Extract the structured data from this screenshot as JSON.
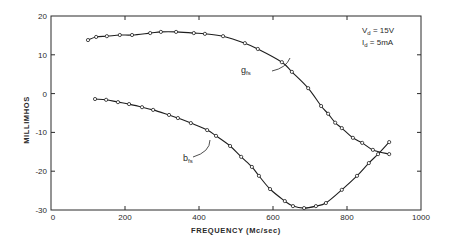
{
  "chart_data": {
    "type": "line",
    "title": "",
    "xlabel": "FREQUENCY  (Mc/sec)",
    "ylabel": "MILLIMHOS",
    "xlim": [
      0,
      1000
    ],
    "ylim": [
      -30,
      20
    ],
    "xticks": [
      0,
      200,
      400,
      600,
      800,
      1000
    ],
    "yticks": [
      20,
      10,
      0,
      -10,
      -20,
      -30
    ],
    "xtick_labels": [
      "0",
      "200",
      "400",
      "600",
      "800",
      "1000"
    ],
    "ytick_labels": [
      "20",
      "10",
      "0",
      "-10",
      "-20",
      "-30"
    ],
    "grid": false,
    "annotations": {
      "line1": "Vd = 15V",
      "line2": "Id = 5mA"
    },
    "series": [
      {
        "name": "g_fs",
        "label_main": "g",
        "label_sub": "fs",
        "x": [
          100,
          122,
          151,
          186,
          219,
          268,
          297,
          338,
          386,
          416,
          465,
          524,
          559,
          624,
          651,
          695,
          730,
          749,
          768,
          786,
          816,
          841,
          870,
          914
        ],
        "y": [
          13.8,
          14.6,
          14.8,
          15.1,
          15.1,
          15.6,
          15.9,
          15.9,
          15.6,
          15.4,
          14.8,
          13.0,
          11.5,
          8.1,
          5.6,
          1.4,
          -3.2,
          -5.2,
          -7.5,
          -8.9,
          -11.4,
          -12.7,
          -14.5,
          -15.6
        ]
      },
      {
        "name": "b_fs",
        "label_main": "b",
        "label_sub": "fs",
        "x": [
          119,
          149,
          181,
          211,
          246,
          276,
          319,
          343,
          378,
          422,
          446,
          484,
          514,
          543,
          562,
          592,
          632,
          654,
          684,
          716,
          743,
          786,
          827,
          859,
          884,
          914
        ],
        "y": [
          -1.4,
          -1.6,
          -2.2,
          -2.7,
          -3.5,
          -4.2,
          -5.5,
          -6.3,
          -7.6,
          -9.4,
          -10.9,
          -13.5,
          -16.3,
          -18.9,
          -21.2,
          -24.6,
          -27.7,
          -29.0,
          -29.5,
          -29.0,
          -28.2,
          -24.8,
          -21.2,
          -17.9,
          -15.6,
          -12.5
        ]
      }
    ]
  }
}
